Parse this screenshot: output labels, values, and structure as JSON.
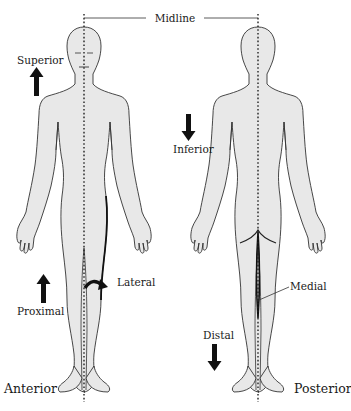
{
  "diagram": {
    "title_label": "Midline",
    "figures": [
      {
        "id": "anterior",
        "label": "Anterior",
        "view": "front"
      },
      {
        "id": "posterior",
        "label": "Posterior",
        "view": "back"
      }
    ],
    "direction_labels": {
      "superior": "Superior",
      "inferior": "Inferior",
      "proximal": "Proximal",
      "distal": "Distal",
      "lateral": "Lateral",
      "medial": "Medial"
    },
    "arrows": [
      {
        "name": "superior-arrow",
        "direction": "up"
      },
      {
        "name": "inferior-arrow",
        "direction": "down"
      },
      {
        "name": "proximal-arrow",
        "direction": "up"
      },
      {
        "name": "distal-arrow",
        "direction": "down"
      },
      {
        "name": "lateral-arrow",
        "direction": "curved-outward"
      }
    ],
    "colors": {
      "body_fill": "#e8e8e8",
      "outline": "#333333",
      "text": "#1a1a1a",
      "background": "#ffffff"
    }
  }
}
